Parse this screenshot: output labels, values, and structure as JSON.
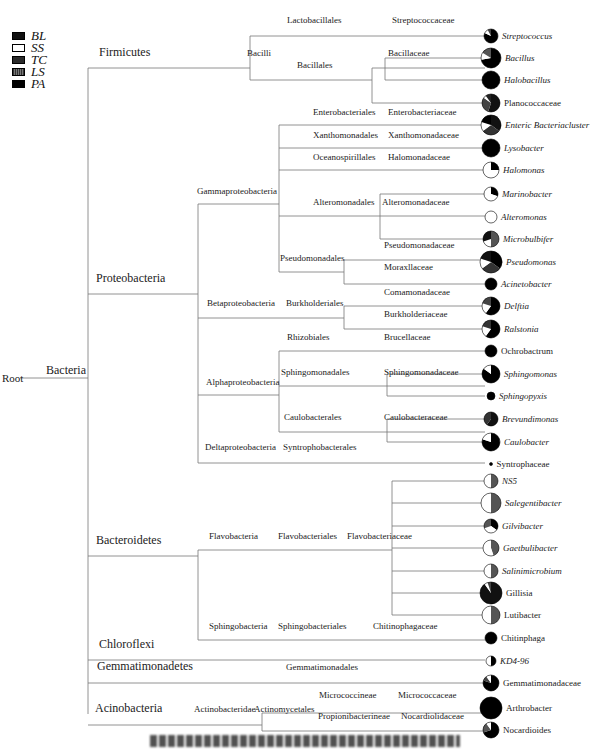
{
  "legend": [
    {
      "label": "BL",
      "fill": "#111111"
    },
    {
      "label": "SS",
      "fill": "#ffffff"
    },
    {
      "label": "TC",
      "fill": "#2a2a2a"
    },
    {
      "label": "LS",
      "fill": "#555555"
    },
    {
      "label": "PA",
      "fill": "#000000"
    }
  ],
  "root": {
    "label": "Root",
    "x": 2,
    "y": 378
  },
  "kingdom": {
    "label": "Bacteria",
    "x": 46,
    "y": 370
  },
  "phyla": [
    {
      "label": "Firmicutes",
      "x": 99,
      "y": 58
    },
    {
      "label": "Proteobacteria",
      "x": 96,
      "y": 284
    },
    {
      "label": "Bacteroidetes",
      "x": 96,
      "y": 546
    },
    {
      "label": "Chloroflexi",
      "x": 99,
      "y": 650
    },
    {
      "label": "Gemmatimonadetes",
      "x": 97,
      "y": 672
    },
    {
      "label": "Acinobacteria",
      "x": 95,
      "y": 714
    }
  ],
  "labels": [
    {
      "text": "Bacilli",
      "x": 247,
      "y": 58
    },
    {
      "text": "Lactobacillales",
      "x": 287,
      "y": 25
    },
    {
      "text": "Bacillales",
      "x": 297,
      "y": 70
    },
    {
      "text": "Streptococcaceae",
      "x": 392,
      "y": 25
    },
    {
      "text": "Bacillaceae",
      "x": 388,
      "y": 58
    },
    {
      "text": "Gammaproteobacteria",
      "x": 197,
      "y": 196
    },
    {
      "text": "Enterobacteriales",
      "x": 313,
      "y": 117
    },
    {
      "text": "Xanthomonadales",
      "x": 313,
      "y": 140
    },
    {
      "text": "Oceanospirillales",
      "x": 313,
      "y": 162
    },
    {
      "text": "Alteromonadales",
      "x": 313,
      "y": 207
    },
    {
      "text": "Pseudomonadales",
      "x": 280,
      "y": 263
    },
    {
      "text": "Enterobacteriaceae",
      "x": 388,
      "y": 117
    },
    {
      "text": "Xanthomonadaceae",
      "x": 388,
      "y": 140
    },
    {
      "text": "Halomonadaceae",
      "x": 388,
      "y": 162
    },
    {
      "text": "Alteromonadaceae",
      "x": 382,
      "y": 207
    },
    {
      "text": "Pseudomonadaceae",
      "x": 384,
      "y": 250
    },
    {
      "text": "Moraxllaceae",
      "x": 384,
      "y": 272
    },
    {
      "text": "Betaproteobacteria",
      "x": 207,
      "y": 308
    },
    {
      "text": "Burkholderiales",
      "x": 286,
      "y": 308
    },
    {
      "text": "Comamonadaceae",
      "x": 384,
      "y": 297
    },
    {
      "text": "Burkholderiaceae",
      "x": 384,
      "y": 319
    },
    {
      "text": "Alphaproteobacteria",
      "x": 206,
      "y": 387
    },
    {
      "text": "Rhizobiales",
      "x": 287,
      "y": 342
    },
    {
      "text": "Sphingomonadales",
      "x": 281,
      "y": 377
    },
    {
      "text": "Caulobacterales",
      "x": 284,
      "y": 422
    },
    {
      "text": "Brucellaceae",
      "x": 384,
      "y": 342
    },
    {
      "text": "Sphingomonadaceae",
      "x": 384,
      "y": 377
    },
    {
      "text": "Caulobacteraceae",
      "x": 384,
      "y": 422
    },
    {
      "text": "Deltaproteobacteria",
      "x": 205,
      "y": 452
    },
    {
      "text": "Syntrophobacterales",
      "x": 283,
      "y": 452
    },
    {
      "text": "Flavobacteria",
      "x": 209,
      "y": 541
    },
    {
      "text": "Flavobacteriales",
      "x": 278,
      "y": 541
    },
    {
      "text": "Flavobacteriaceae",
      "x": 347,
      "y": 541
    },
    {
      "text": "Sphingobacteria",
      "x": 209,
      "y": 631
    },
    {
      "text": "Sphingobacteriales",
      "x": 278,
      "y": 631
    },
    {
      "text": "Chitinophagaceae",
      "x": 373,
      "y": 631
    },
    {
      "text": "Gemmatimonadales",
      "x": 286,
      "y": 672
    },
    {
      "text": "Actinobacteridae",
      "x": 194,
      "y": 714
    },
    {
      "text": "Actinomycetales",
      "x": 254,
      "y": 714
    },
    {
      "text": "Micrococcineae",
      "x": 319,
      "y": 700
    },
    {
      "text": "Micrococcaceae",
      "x": 398,
      "y": 700
    },
    {
      "text": "Propionibacterineae",
      "x": 318,
      "y": 721
    },
    {
      "text": "Nocardiolidaceae",
      "x": 401,
      "y": 721
    }
  ],
  "leaves": [
    {
      "name": "Streptococcus",
      "y": 36,
      "r": 7,
      "slices": [
        [
          "#000",
          0.82
        ],
        [
          "#fff",
          0.1
        ],
        [
          "#444",
          0.08
        ]
      ],
      "italic": true
    },
    {
      "name": "Bacillus",
      "y": 58,
      "r": 10,
      "slices": [
        [
          "#000",
          0.72
        ],
        [
          "#fff",
          0.12
        ],
        [
          "#555",
          0.16
        ]
      ],
      "italic": true
    },
    {
      "name": "Halobacillus",
      "y": 80,
      "r": 9,
      "slices": [
        [
          "#000",
          1.0
        ]
      ],
      "italic": true
    },
    {
      "name": "Planococcaceae",
      "y": 103,
      "r": 9,
      "slices": [
        [
          "#111",
          0.55
        ],
        [
          "#444",
          0.3
        ],
        [
          "#fff",
          0.05
        ],
        [
          "#222",
          0.1
        ]
      ],
      "italic": false
    },
    {
      "name": "Enteric Bacteriacluster",
      "y": 125,
      "r": 10,
      "slices": [
        [
          "#111",
          0.35
        ],
        [
          "#333",
          0.3
        ],
        [
          "#fff",
          0.15
        ],
        [
          "#000",
          0.2
        ]
      ],
      "italic": true
    },
    {
      "name": "Lysobacter",
      "y": 148,
      "r": 9,
      "slices": [
        [
          "#000",
          1.0
        ]
      ],
      "italic": true
    },
    {
      "name": "Halomonas",
      "y": 170,
      "r": 8,
      "slices": [
        [
          "#000",
          0.25
        ],
        [
          "#fff",
          0.75
        ]
      ],
      "italic": true
    },
    {
      "name": "Marinobacter",
      "y": 194,
      "r": 7,
      "slices": [
        [
          "#000",
          0.3
        ],
        [
          "#fff",
          0.7
        ]
      ],
      "italic": true
    },
    {
      "name": "Alteromonas",
      "y": 217,
      "r": 6,
      "slices": [
        [
          "#fff",
          1.0
        ]
      ],
      "italic": true
    },
    {
      "name": "Microbulbifer",
      "y": 239,
      "r": 8,
      "slices": [
        [
          "#555",
          0.5
        ],
        [
          "#fff",
          0.2
        ],
        [
          "#111",
          0.3
        ]
      ],
      "italic": true
    },
    {
      "name": "Pseudomonas",
      "y": 262,
      "r": 11,
      "slices": [
        [
          "#000",
          0.35
        ],
        [
          "#333",
          0.3
        ],
        [
          "#fff",
          0.15
        ],
        [
          "#111",
          0.2
        ]
      ],
      "italic": true
    },
    {
      "name": "Acinetobacter",
      "y": 284,
      "r": 6,
      "slices": [
        [
          "#000",
          1.0
        ]
      ],
      "italic": true
    },
    {
      "name": "Delftia",
      "y": 306,
      "r": 9,
      "slices": [
        [
          "#000",
          0.6
        ],
        [
          "#fff",
          0.2
        ],
        [
          "#444",
          0.2
        ]
      ],
      "italic": true
    },
    {
      "name": "Ralstonia",
      "y": 329,
      "r": 9,
      "slices": [
        [
          "#000",
          0.6
        ],
        [
          "#fff",
          0.2
        ],
        [
          "#333",
          0.2
        ]
      ],
      "italic": true
    },
    {
      "name": "Ochrobactrum",
      "y": 351,
      "r": 6,
      "slices": [
        [
          "#000",
          1.0
        ]
      ],
      "italic": false
    },
    {
      "name": "Sphingomonas",
      "y": 374,
      "r": 9,
      "slices": [
        [
          "#000",
          0.85
        ],
        [
          "#fff",
          0.15
        ]
      ],
      "italic": true
    },
    {
      "name": "Sphingopyxis",
      "y": 396,
      "r": 4,
      "slices": [
        [
          "#000",
          1.0
        ]
      ],
      "italic": true
    },
    {
      "name": "Brevundimonas",
      "y": 419,
      "r": 7,
      "slices": [
        [
          "#111",
          0.6
        ],
        [
          "#333",
          0.4
        ]
      ],
      "italic": true
    },
    {
      "name": "Caulobacter",
      "y": 442,
      "r": 9,
      "slices": [
        [
          "#000",
          0.8
        ],
        [
          "#fff",
          0.2
        ]
      ],
      "italic": true
    },
    {
      "name": "Syntrophaceae",
      "y": 464,
      "r": 1.5,
      "slices": [
        [
          "#000",
          1.0
        ]
      ],
      "italic": false
    },
    {
      "name": "NS5",
      "y": 481,
      "r": 7,
      "slices": [
        [
          "#555",
          0.5
        ],
        [
          "#fff",
          0.5
        ]
      ],
      "italic": true
    },
    {
      "name": "Salegentibacter",
      "y": 503,
      "r": 10,
      "slices": [
        [
          "#555",
          0.5
        ],
        [
          "#fff",
          0.5
        ]
      ],
      "italic": true
    },
    {
      "name": "Gilvibacter",
      "y": 526,
      "r": 7,
      "slices": [
        [
          "#000",
          0.35
        ],
        [
          "#fff",
          0.35
        ],
        [
          "#555",
          0.3
        ]
      ],
      "italic": true
    },
    {
      "name": "Gaetbulibacter",
      "y": 548,
      "r": 8,
      "slices": [
        [
          "#555",
          0.45
        ],
        [
          "#fff",
          0.55
        ]
      ],
      "italic": true
    },
    {
      "name": "Salinimicrobium",
      "y": 571,
      "r": 7,
      "slices": [
        [
          "#555",
          0.5
        ],
        [
          "#fff",
          0.5
        ]
      ],
      "italic": true
    },
    {
      "name": "Gillisia",
      "y": 593,
      "r": 11,
      "slices": [
        [
          "#111",
          0.9
        ],
        [
          "#fff",
          0.05
        ],
        [
          "#444",
          0.05
        ]
      ],
      "italic": false
    },
    {
      "name": "Lutibacter",
      "y": 615,
      "r": 9,
      "slices": [
        [
          "#555",
          0.5
        ],
        [
          "#fff",
          0.5
        ]
      ],
      "italic": false
    },
    {
      "name": "Chitinphaga",
      "y": 638,
      "r": 6,
      "slices": [
        [
          "#000",
          1.0
        ]
      ],
      "italic": false
    },
    {
      "name": "KD4-96",
      "y": 661,
      "r": 5,
      "slices": [
        [
          "#000",
          0.5
        ],
        [
          "#fff",
          0.5
        ]
      ],
      "italic": true
    },
    {
      "name": "Gemmatimonadaceae",
      "y": 683,
      "r": 8,
      "slices": [
        [
          "#000",
          0.8
        ],
        [
          "#444",
          0.1
        ],
        [
          "#fff",
          0.1
        ]
      ],
      "italic": false
    },
    {
      "name": "Arthrobacter",
      "y": 708,
      "r": 11,
      "slices": [
        [
          "#000",
          1.0
        ]
      ],
      "italic": false
    },
    {
      "name": "Nocardioides",
      "y": 730,
      "r": 8,
      "slices": [
        [
          "#000",
          0.7
        ],
        [
          "#555",
          0.2
        ],
        [
          "#fff",
          0.1
        ]
      ],
      "italic": false
    }
  ],
  "leaf_x": 485,
  "lines": [
    [
      20,
      378,
      88,
      378
    ],
    [
      88,
      68,
      88,
      714
    ],
    [
      88,
      68,
      250,
      68
    ],
    [
      88,
      294,
      198,
      294
    ],
    [
      88,
      556,
      198,
      556
    ],
    [
      88,
      660,
      485,
      660
    ],
    [
      88,
      683,
      485,
      683
    ],
    [
      88,
      725,
      262,
      725
    ],
    [
      250,
      36,
      250,
      80
    ],
    [
      250,
      36,
      485,
      36
    ],
    [
      250,
      80,
      372,
      80
    ],
    [
      372,
      68,
      372,
      103
    ],
    [
      372,
      68,
      485,
      68
    ],
    [
      372,
      103,
      485,
      103
    ],
    [
      385,
      58,
      385,
      80
    ],
    [
      385,
      58,
      485,
      58
    ],
    [
      385,
      80,
      485,
      80
    ],
    [
      198,
      204,
      198,
      463
    ],
    [
      198,
      204,
      279,
      204
    ],
    [
      198,
      318,
      279,
      318
    ],
    [
      198,
      395,
      279,
      395
    ],
    [
      198,
      463,
      485,
      463
    ],
    [
      279,
      125,
      279,
      272
    ],
    [
      279,
      125,
      485,
      125
    ],
    [
      279,
      148,
      485,
      148
    ],
    [
      279,
      170,
      485,
      170
    ],
    [
      279,
      216,
      485,
      216
    ],
    [
      279,
      272,
      344,
      272
    ],
    [
      344,
      260,
      344,
      284
    ],
    [
      344,
      260,
      485,
      260
    ],
    [
      344,
      284,
      485,
      284
    ],
    [
      380,
      194,
      380,
      239
    ],
    [
      380,
      194,
      485,
      194
    ],
    [
      380,
      239,
      485,
      239
    ],
    [
      279,
      318,
      344,
      318
    ],
    [
      344,
      306,
      344,
      329
    ],
    [
      344,
      306,
      485,
      306
    ],
    [
      344,
      329,
      485,
      329
    ],
    [
      279,
      351,
      279,
      432
    ],
    [
      279,
      351,
      485,
      351
    ],
    [
      279,
      386,
      485,
      386
    ],
    [
      279,
      432,
      485,
      432
    ],
    [
      387,
      374,
      387,
      396
    ],
    [
      387,
      374,
      485,
      374
    ],
    [
      387,
      396,
      485,
      396
    ],
    [
      387,
      419,
      387,
      442
    ],
    [
      387,
      419,
      485,
      419
    ],
    [
      387,
      442,
      485,
      442
    ],
    [
      198,
      550,
      198,
      640
    ],
    [
      198,
      550,
      392,
      550
    ],
    [
      198,
      640,
      485,
      640
    ],
    [
      392,
      481,
      392,
      615
    ],
    [
      392,
      481,
      485,
      481
    ],
    [
      392,
      503,
      485,
      503
    ],
    [
      392,
      526,
      485,
      526
    ],
    [
      392,
      548,
      485,
      548
    ],
    [
      392,
      571,
      485,
      571
    ],
    [
      392,
      593,
      485,
      593
    ],
    [
      392,
      615,
      485,
      615
    ],
    [
      262,
      713,
      262,
      731
    ],
    [
      262,
      713,
      485,
      713
    ],
    [
      262,
      731,
      485,
      731
    ]
  ]
}
